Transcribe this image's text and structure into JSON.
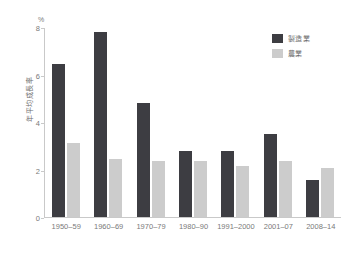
{
  "chart_data": {
    "type": "bar",
    "title": "",
    "subtitle": "",
    "xlabel": "",
    "ylabel": "年平均成長率",
    "y_unit": "%",
    "ylim": [
      0,
      8
    ],
    "yticks": [
      0,
      2,
      4,
      6,
      8
    ],
    "ytick_labels": [
      "0",
      "2",
      "4",
      "6",
      "8"
    ],
    "grid": false,
    "legend_position": "top-right",
    "categories": [
      "1950–59",
      "1960–69",
      "1970–79",
      "1980–90",
      "1991–2000",
      "2001–07",
      "2008–14"
    ],
    "series": [
      {
        "name": "製造業",
        "color": "#3d3d42",
        "values": [
          6.45,
          7.8,
          4.8,
          2.8,
          2.8,
          3.5,
          1.55
        ]
      },
      {
        "name": "農業",
        "color": "#cccccc",
        "values": [
          3.1,
          2.45,
          2.35,
          2.35,
          2.15,
          2.35,
          2.05
        ]
      }
    ]
  },
  "colors": {
    "manufacturing": "#3d3d42",
    "agriculture": "#cccccc",
    "axis": "#c9c9c9",
    "text": "#6e6e6e",
    "background": "#ffffff"
  }
}
